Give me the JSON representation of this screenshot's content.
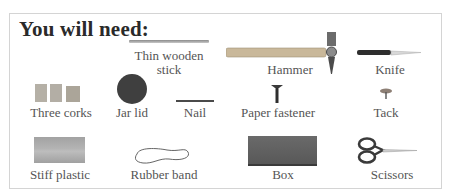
{
  "header": {
    "title": "You will need:"
  },
  "items": [
    {
      "name": "Thin wooden stick",
      "line1": "Thin wooden",
      "line2": "stick",
      "icon": "stick"
    },
    {
      "name": "Hammer",
      "label": "Hammer",
      "icon": "hammer"
    },
    {
      "name": "Knife",
      "label": "Knife",
      "icon": "knife"
    },
    {
      "name": "Three corks",
      "label": "Three corks",
      "icon": "corks"
    },
    {
      "name": "Jar lid",
      "label": "Jar lid",
      "icon": "jar-lid"
    },
    {
      "name": "Nail",
      "label": "Nail",
      "icon": "nail"
    },
    {
      "name": "Paper fastener",
      "label": "Paper fastener",
      "icon": "paper-fastener"
    },
    {
      "name": "Tack",
      "label": "Tack",
      "icon": "tack"
    },
    {
      "name": "Stiff plastic",
      "label": "Stiff plastic",
      "icon": "plastic"
    },
    {
      "name": "Rubber band",
      "label": "Rubber band",
      "icon": "rubber-band"
    },
    {
      "name": "Box",
      "label": "Box",
      "icon": "box"
    },
    {
      "name": "Scissors",
      "label": "Scissors",
      "icon": "scissors"
    }
  ],
  "colors": {
    "border": "#d4d4d4",
    "title": "#2a2a2a",
    "label": "#555555",
    "jar_lid": "#3f3f3f",
    "box": "#5e5e5e",
    "plastic": "#a8a8a8"
  }
}
